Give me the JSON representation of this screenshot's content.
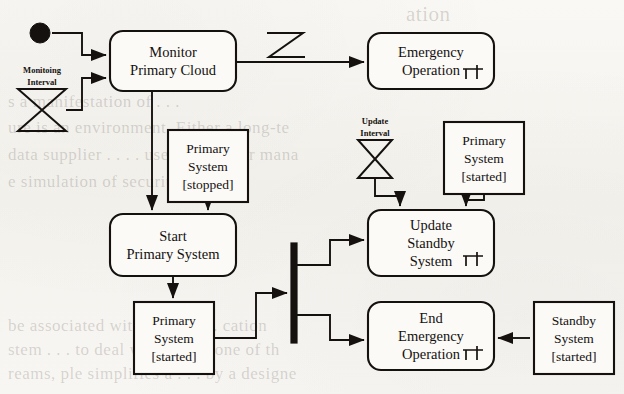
{
  "page": {
    "kind": "scanned-book-page",
    "figure_type": "uml-activity-diagram",
    "background_color": "#f7f5f1",
    "ink_color": "#14110f"
  },
  "background_text": [
    {
      "text": "ation",
      "x": 406,
      "y": 2,
      "size": 21
    },
    {
      "text": "s a manifestation of . . .",
      "x": 8,
      "y": 92,
      "size": 17
    },
    {
      "text": "ure is an environment. Either a long-te",
      "x": 8,
      "y": 118,
      "size": 17
    },
    {
      "text": "data supplier . . . . user-defined or mana",
      "x": 8,
      "y": 145,
      "size": 17
    },
    {
      "text": "e simulation of security, tri",
      "x": 8,
      "y": 172,
      "size": 17
    },
    {
      "text": "be associated with the sp . . . cation",
      "x": 8,
      "y": 316,
      "size": 17
    },
    {
      "text": "stem . . . to deal with this is one of th",
      "x": 8,
      "y": 340,
      "size": 17
    },
    {
      "text": "reams, ple simplifies a . . . by a designe",
      "x": 8,
      "y": 364,
      "size": 17
    }
  ],
  "diagram": {
    "start_node": {
      "name": "initial-node",
      "cx": 40,
      "cy": 33,
      "r": 10
    },
    "activities": [
      {
        "id": "monitor-primary-cloud",
        "lines": [
          "Monitor",
          "Primary Cloud"
        ],
        "x": 110,
        "y": 31,
        "w": 126,
        "h": 60,
        "rake": false
      },
      {
        "id": "emergency-operation",
        "lines": [
          "Emergency",
          "Operation"
        ],
        "x": 368,
        "y": 33,
        "w": 126,
        "h": 56,
        "rake": true
      },
      {
        "id": "start-primary-system",
        "lines": [
          "Start",
          "Primary System"
        ],
        "x": 110,
        "y": 214,
        "w": 126,
        "h": 62,
        "rake": false
      },
      {
        "id": "update-standby-system",
        "lines": [
          "Update",
          "Standby",
          "System"
        ],
        "x": 368,
        "y": 210,
        "w": 126,
        "h": 66,
        "rake": true
      },
      {
        "id": "end-emergency-operation",
        "lines": [
          "End",
          "Emergency",
          "Operation"
        ],
        "x": 368,
        "y": 302,
        "w": 126,
        "h": 68,
        "rake": true
      }
    ],
    "object_nodes": [
      {
        "id": "primary-system-stopped",
        "lines": [
          "Primary",
          "System",
          "[stopped]"
        ],
        "x": 168,
        "y": 130,
        "w": 80,
        "h": 72
      },
      {
        "id": "primary-system-started-right",
        "lines": [
          "Primary",
          "System",
          "[started]"
        ],
        "x": 444,
        "y": 122,
        "w": 80,
        "h": 72
      },
      {
        "id": "primary-system-started-bottom",
        "lines": [
          "Primary",
          "System",
          "[started]"
        ],
        "x": 134,
        "y": 302,
        "w": 80,
        "h": 72
      },
      {
        "id": "standby-system-started",
        "lines": [
          "Standby",
          "System",
          "[started]"
        ],
        "x": 534,
        "y": 302,
        "w": 80,
        "h": 72
      }
    ],
    "timers": [
      {
        "id": "monitoing-interval-timer",
        "label_lines": [
          "Monitoing",
          "Interval"
        ],
        "label_x": 42,
        "label_y1": 73,
        "label_y2": 85,
        "cx": 42,
        "top": 89,
        "bottom": 131,
        "halfwidth": 24
      },
      {
        "id": "update-interval-timer",
        "label_lines": [
          "Update",
          "Interval"
        ],
        "label_x": 375,
        "label_y1": 124,
        "label_y2": 136,
        "cx": 375,
        "top": 140,
        "bottom": 178,
        "halfwidth": 17
      }
    ],
    "fork_bar": {
      "id": "fork-join-bar",
      "x": 291,
      "y": 243,
      "w": 6,
      "h": 100
    },
    "signal_glyph": {
      "id": "signal-zigzag-glyph",
      "description": "Z shaped send-signal marker above the Monitor to Emergency Operation flow",
      "points": "267,33 303,33 269,57 305,57"
    },
    "edges": [
      {
        "id": "initial-to-monitor",
        "path": "M 52 33 L 82 33 L 82 55 L 106 55",
        "arrow": true
      },
      {
        "id": "monitoing-timer-to-monitor",
        "path": "M 66 110 L 82 110 L 82 78 L 106 78",
        "arrow": true
      },
      {
        "id": "monitor-to-emergency",
        "path": "M 236 62 L 364 62",
        "arrow": true
      },
      {
        "id": "monitor-to-start",
        "path": "M 152 91 L 152 210",
        "arrow": true
      },
      {
        "id": "stopped-to-start",
        "path": "M 208 202 L 208 210",
        "arrow": true
      },
      {
        "id": "start-to-started-bottom",
        "path": "M 173 276 L 173 298",
        "arrow": true
      },
      {
        "id": "started-bottom-to-fork",
        "path": "M 214 338 L 256 338 L 256 293 L 287 293",
        "arrow": true
      },
      {
        "id": "fork-to-update",
        "path": "M 297 265 L 330 265 L 330 240 L 364 240",
        "arrow": true
      },
      {
        "id": "fork-to-end-emergency",
        "path": "M 297 315 L 330 315 L 330 340 L 364 340",
        "arrow": true
      },
      {
        "id": "update-timer-to-update",
        "path": "M 375 178 L 375 196 L 400 196 L 400 206",
        "arrow": true
      },
      {
        "id": "started-right-to-update",
        "path": "M 484 194 L 484 200 L 466 200 L 466 206",
        "arrow": true
      },
      {
        "id": "standby-to-end-emergency",
        "path": "M 530 338 L 498 338",
        "arrow": true
      }
    ]
  }
}
